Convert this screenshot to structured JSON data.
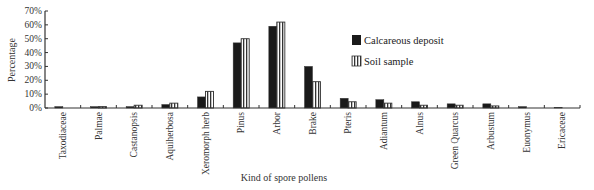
{
  "chart_data": {
    "type": "bar",
    "title": "",
    "xlabel": "Kind of spore pollens",
    "ylabel": "Percentage",
    "ylim": [
      0,
      70
    ],
    "yticks": [
      "0%",
      "10%",
      "20%",
      "30%",
      "40%",
      "50%",
      "60%",
      "70%"
    ],
    "grid": false,
    "legend_position": "upper right",
    "categories": [
      "Taxodiaceae",
      "Palmae",
      "Castanopsis",
      "Aquiherbosa",
      "Xeromorph herb",
      "Pinus",
      "Arbor",
      "Brake",
      "Pteris",
      "Adiantum",
      "Alnus",
      "Green Quarcus",
      "Arbustum",
      "Euonymus",
      "Ericaceae"
    ],
    "series": [
      {
        "name": "Calcareous deposit",
        "style": "solid",
        "color": "#1a1a1a",
        "values": [
          1,
          1,
          1,
          2.5,
          8,
          47,
          59,
          30,
          7,
          6,
          4.5,
          3,
          3,
          1,
          0.5
        ]
      },
      {
        "name": "Soil sample",
        "style": "vertical-stripes",
        "color": "#ffffff",
        "values": [
          0,
          1,
          2,
          3.5,
          12,
          50,
          62,
          19,
          4.5,
          3.5,
          2,
          2,
          1.5,
          0,
          0
        ]
      }
    ]
  }
}
